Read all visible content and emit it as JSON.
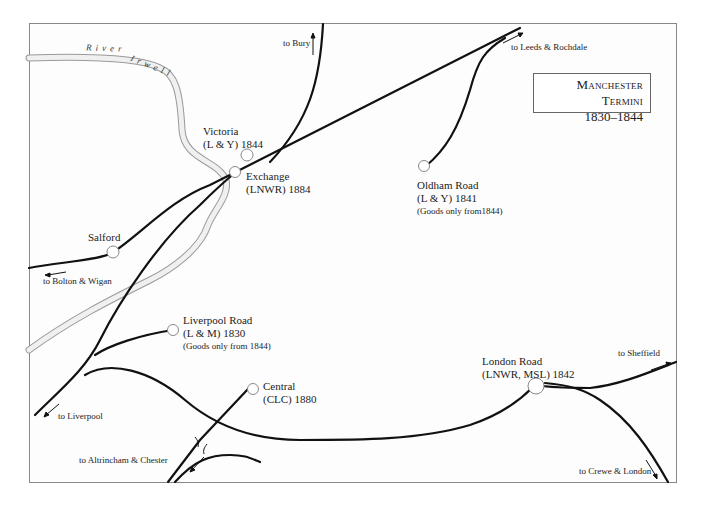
{
  "title": {
    "line1": "Manchester Termini",
    "line2": "1830–1844"
  },
  "river": {
    "word1": "River",
    "word2": "Irwell"
  },
  "stations": [
    {
      "id": "victoria",
      "name": "Victoria",
      "detail": "(L & Y) 1844",
      "note": ""
    },
    {
      "id": "exchange",
      "name": "Exchange",
      "detail": "(LNWR) 1884",
      "note": ""
    },
    {
      "id": "oldham-road",
      "name": "Oldham Road",
      "detail": "(L & Y) 1841",
      "note": "(Goods only from1844)"
    },
    {
      "id": "salford",
      "name": "Salford",
      "detail": "",
      "note": ""
    },
    {
      "id": "liverpool-road",
      "name": "Liverpool Road",
      "detail": "(L & M) 1830",
      "note": "(Goods only from 1844)"
    },
    {
      "id": "central",
      "name": "Central",
      "detail": "(CLC) 1880",
      "note": ""
    },
    {
      "id": "london-road",
      "name": "London Road",
      "detail": "(LNWR, MSL) 1842",
      "note": ""
    }
  ],
  "directions": {
    "bury": "to Bury",
    "leeds": "to Leeds & Rochdale",
    "bolton": "to Bolton & Wigan",
    "liverpool": "to Liverpool",
    "altrincham": "to Altrincham & Chester",
    "sheffield": "to Sheffield",
    "crewe": "to Crewe & London"
  },
  "colors": {
    "track": "#111111",
    "river_edge": "#9a9a9a",
    "river_fill": "#eeeeee",
    "frame": "#888888",
    "station_fill": "#ffffff",
    "station_stroke": "#888888"
  }
}
